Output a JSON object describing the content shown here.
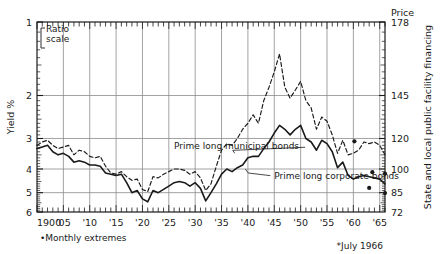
{
  "chart_data": {
    "type": "line",
    "title": "",
    "ylabel": "Yield %",
    "xlabel": "",
    "y_right_header": "Price",
    "y_right_label": "State and local public facility financing",
    "scale_note_line1": "Ratio",
    "scale_note_line2": "scale",
    "grid": true,
    "y_axis_inverted": true,
    "y_scale": "log",
    "ylim": [
      1,
      6
    ],
    "xlim": [
      1900,
      1966
    ],
    "yticks": [
      1,
      2,
      3,
      4,
      5,
      6
    ],
    "ytick_labels": [
      "1",
      "2",
      "3",
      "4",
      "5",
      "6"
    ],
    "y_right_ticks": [
      178,
      145,
      120,
      100,
      85,
      72
    ],
    "y_right_tick_labels": [
      "178",
      "145",
      "120",
      "100",
      "85",
      "72"
    ],
    "xticks": [
      1900,
      1905,
      1910,
      1915,
      1920,
      1925,
      1930,
      1935,
      1940,
      1945,
      1950,
      1955,
      1960,
      1965
    ],
    "xtick_labels": [
      "1900",
      "'05",
      "'10",
      "'15",
      "'20",
      "'25",
      "'30",
      "'35",
      "'40",
      "'45",
      "'50",
      "'55",
      "'60",
      "'65"
    ],
    "footnotes": [
      "•Monthly extremes",
      "*July 1966"
    ],
    "legend_position": "inline-annotations",
    "series": [
      {
        "name": "Prime long municipal bonds",
        "style": "dashed",
        "color": "#1a1a1a",
        "x": [
          1900,
          1901,
          1902,
          1903,
          1904,
          1905,
          1906,
          1907,
          1908,
          1909,
          1910,
          1911,
          1912,
          1913,
          1914,
          1915,
          1916,
          1917,
          1918,
          1919,
          1920,
          1921,
          1922,
          1923,
          1924,
          1925,
          1926,
          1927,
          1928,
          1929,
          1930,
          1931,
          1932,
          1933,
          1934,
          1935,
          1936,
          1937,
          1938,
          1939,
          1940,
          1941,
          1942,
          1943,
          1944,
          1945,
          1946,
          1947,
          1948,
          1949,
          1950,
          1951,
          1952,
          1953,
          1954,
          1955,
          1956,
          1957,
          1958,
          1959,
          1960,
          1961,
          1962,
          1963,
          1964,
          1965,
          1966
        ],
        "values": [
          3.2,
          3.1,
          3.05,
          3.2,
          3.3,
          3.25,
          3.2,
          3.5,
          3.35,
          3.4,
          3.55,
          3.6,
          3.55,
          3.9,
          4.15,
          4.2,
          4.1,
          4.3,
          4.45,
          4.4,
          4.85,
          4.95,
          4.3,
          4.35,
          4.2,
          4.1,
          4.0,
          4.0,
          4.05,
          4.2,
          4.1,
          4.35,
          4.9,
          4.6,
          3.9,
          3.35,
          3.15,
          3.2,
          3.0,
          2.75,
          2.6,
          2.4,
          2.6,
          2.1,
          1.85,
          1.6,
          1.35,
          1.85,
          2.05,
          1.9,
          1.75,
          2.1,
          2.25,
          2.75,
          2.45,
          2.55,
          2.9,
          3.45,
          3.05,
          3.5,
          3.45,
          3.35,
          3.1,
          3.15,
          3.1,
          3.2,
          3.5
        ]
      },
      {
        "name": "Prime long corporate bonds",
        "style": "solid",
        "color": "#1a1a1a",
        "x": [
          1900,
          1901,
          1902,
          1903,
          1904,
          1905,
          1906,
          1907,
          1908,
          1909,
          1910,
          1911,
          1912,
          1913,
          1914,
          1915,
          1916,
          1917,
          1918,
          1919,
          1920,
          1921,
          1922,
          1923,
          1924,
          1925,
          1926,
          1927,
          1928,
          1929,
          1930,
          1931,
          1932,
          1933,
          1934,
          1935,
          1936,
          1937,
          1938,
          1939,
          1940,
          1941,
          1942,
          1943,
          1944,
          1945,
          1946,
          1947,
          1948,
          1949,
          1950,
          1951,
          1952,
          1953,
          1954,
          1955,
          1956,
          1957,
          1958,
          1959,
          1960,
          1961,
          1962,
          1963,
          1964,
          1965,
          1966
        ],
        "values": [
          3.3,
          3.25,
          3.2,
          3.4,
          3.5,
          3.45,
          3.55,
          3.75,
          3.7,
          3.75,
          3.85,
          3.85,
          3.9,
          4.15,
          4.2,
          4.25,
          4.2,
          4.55,
          5.0,
          4.9,
          5.3,
          5.45,
          4.9,
          5.0,
          4.85,
          4.7,
          4.55,
          4.5,
          4.55,
          4.7,
          4.55,
          4.8,
          5.4,
          5.0,
          4.6,
          4.2,
          4.0,
          4.1,
          3.95,
          3.85,
          3.6,
          3.55,
          3.55,
          3.3,
          3.1,
          2.85,
          2.65,
          2.75,
          2.9,
          2.75,
          2.65,
          3.0,
          3.1,
          3.35,
          3.05,
          3.15,
          3.4,
          3.95,
          3.75,
          4.25,
          4.4,
          4.3,
          4.25,
          4.3,
          4.35,
          4.4,
          4.6
        ]
      }
    ],
    "markers": {
      "name": "Monthly extremes",
      "symbol": "dot",
      "points": [
        {
          "x": 1960.2,
          "y": 3.08,
          "series": "corporate"
        },
        {
          "x": 1963.6,
          "y": 4.12,
          "series": "municipal"
        },
        {
          "x": 1963.0,
          "y": 4.78,
          "series": "corporate"
        },
        {
          "x": 1966.0,
          "y": 4.18,
          "series": "municipal-july"
        },
        {
          "x": 1966.0,
          "y": 5.02,
          "series": "corporate-july"
        }
      ]
    },
    "annotations": [
      {
        "text": "Prime long municipal bonds",
        "x": 1926,
        "y": 3.32,
        "leader_to_x": 1937.5,
        "leader_to_y": 3.45
      },
      {
        "text": "Prime long corporate bonds",
        "x": 1945,
        "y": 4.38,
        "leader_to_x": 1939.5,
        "leader_to_y": 4.0
      }
    ]
  }
}
